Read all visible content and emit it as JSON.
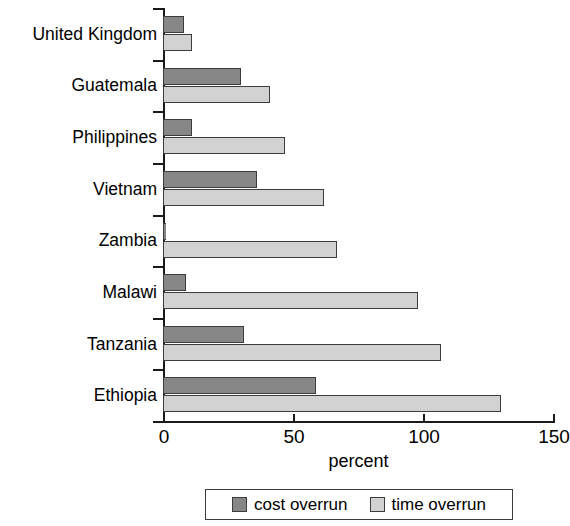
{
  "chart_data": {
    "type": "bar",
    "orientation": "horizontal",
    "title": "",
    "xlabel": "percent",
    "ylabel": "",
    "xlim": [
      0,
      150
    ],
    "xticks": [
      0,
      50,
      100,
      150
    ],
    "xtick_labels": [
      "0",
      "50",
      "100",
      "150"
    ],
    "grid": false,
    "legend_position": "bottom",
    "categories": [
      "United Kingdom",
      "Guatemala",
      "Philippines",
      "Vietnam",
      "Zambia",
      "Malawi",
      "Tanzania",
      "Ethiopia"
    ],
    "series": [
      {
        "name": "cost overrun",
        "color": "#878787",
        "values": [
          8,
          30,
          11,
          36,
          0.5,
          9,
          31,
          59
        ]
      },
      {
        "name": "time overrun",
        "color": "#d2d2d2",
        "values": [
          11,
          41,
          47,
          62,
          67,
          98,
          107,
          130
        ]
      }
    ]
  },
  "legend": {
    "items": [
      {
        "label": "cost overrun",
        "color": "#878787"
      },
      {
        "label": "time overrun",
        "color": "#d2d2d2"
      }
    ]
  },
  "axis": {
    "x_title": "percent"
  }
}
